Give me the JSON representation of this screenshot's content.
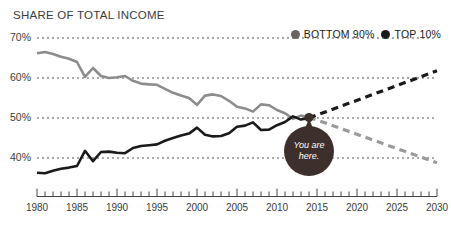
{
  "chart": {
    "title": "SHARE OF TOTAL INCOME",
    "legend": [
      {
        "label": "BOTTOM 90%",
        "color": "#8c8c8c",
        "icon": "legend-dot-bottom90"
      },
      {
        "label": "TOP 10%",
        "color": "#1a1a1a",
        "icon": "legend-dot-top10"
      }
    ],
    "annotation": {
      "line1": "You are",
      "line2": "here."
    },
    "y_ticks": [
      "70%",
      "60%",
      "50%",
      "40%"
    ],
    "x_ticks": [
      "1980",
      "1985",
      "1990",
      "1995",
      "2000",
      "2005",
      "2010",
      "2015",
      "2020",
      "2025",
      "2030"
    ]
  },
  "chart_data": {
    "type": "line",
    "title": "SHARE OF TOTAL INCOME",
    "xlabel": "",
    "ylabel": "Share of total income (%)",
    "xlim": [
      1980,
      2030
    ],
    "ylim": [
      33,
      70
    ],
    "ytick_values": [
      70,
      60,
      50,
      40
    ],
    "xtick_values": [
      1980,
      1985,
      1990,
      1995,
      2000,
      2005,
      2010,
      2015,
      2020,
      2025,
      2030
    ],
    "grid": "horizontal-dotted",
    "legend_position": "top-right",
    "minor_ticks": "every year on x-axis",
    "annotations": [
      {
        "text": "You are here.",
        "x": 2014,
        "y": 50,
        "style": "dark-circle-callout"
      }
    ],
    "series": [
      {
        "name": "BOTTOM 90%",
        "color": "#8c8c8c",
        "style": "solid",
        "x": [
          1980,
          1981,
          1982,
          1983,
          1984,
          1985,
          1986,
          1987,
          1988,
          1989,
          1990,
          1991,
          1992,
          1993,
          1994,
          1995,
          1996,
          1997,
          1998,
          1999,
          2000,
          2001,
          2002,
          2003,
          2004,
          2005,
          2006,
          2007,
          2008,
          2009,
          2010,
          2011,
          2012,
          2013,
          2014
        ],
        "values": [
          66.2,
          66.5,
          66.0,
          65.3,
          64.8,
          64.0,
          60.3,
          62.5,
          60.5,
          60.0,
          60.2,
          60.5,
          59.3,
          58.6,
          58.4,
          58.3,
          57.3,
          56.3,
          55.6,
          55.0,
          53.3,
          55.6,
          55.9,
          55.5,
          54.3,
          52.8,
          52.4,
          51.6,
          53.4,
          53.2,
          52.0,
          51.2,
          49.8,
          50.6,
          50.2
        ]
      },
      {
        "name": "BOTTOM 90% (projected)",
        "color": "#9a9a9a",
        "style": "dashed",
        "x": [
          2014,
          2030
        ],
        "values": [
          50.2,
          38.8
        ]
      },
      {
        "name": "TOP 10%",
        "color": "#1a1a1a",
        "style": "solid",
        "x": [
          1980,
          1981,
          1982,
          1983,
          1984,
          1985,
          1986,
          1987,
          1988,
          1989,
          1990,
          1991,
          1992,
          1993,
          1994,
          1995,
          1996,
          1997,
          1998,
          1999,
          2000,
          2001,
          2002,
          2003,
          2004,
          2005,
          2006,
          2007,
          2008,
          2009,
          2010,
          2011,
          2012,
          2013,
          2014
        ],
        "values": [
          36.3,
          36.2,
          36.8,
          37.3,
          37.6,
          38.0,
          41.8,
          39.2,
          41.5,
          41.6,
          41.3,
          41.2,
          42.5,
          43.0,
          43.2,
          43.4,
          44.3,
          45.0,
          45.6,
          46.1,
          47.6,
          45.8,
          45.4,
          45.5,
          46.2,
          47.8,
          48.1,
          48.9,
          47.0,
          47.1,
          48.2,
          49.0,
          50.4,
          49.6,
          50.0
        ]
      },
      {
        "name": "TOP 10% (projected)",
        "color": "#1a1a1a",
        "style": "dashed",
        "x": [
          2014,
          2030
        ],
        "values": [
          50.0,
          61.8
        ]
      }
    ]
  }
}
